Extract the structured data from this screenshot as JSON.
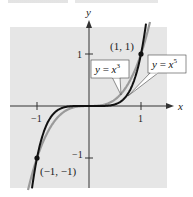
{
  "chart_data": {
    "type": "line",
    "title": "",
    "xlabel": "x",
    "ylabel": "y",
    "xlim": [
      -1.5,
      1.5
    ],
    "ylim": [
      -1.6,
      1.6
    ],
    "grid": false,
    "background": "#e6e6e6",
    "x_ticks": [
      {
        "value": -1,
        "label": "−1"
      },
      {
        "value": 1,
        "label": "1"
      }
    ],
    "y_ticks": [
      {
        "value": 1,
        "label": "1"
      },
      {
        "value": -1,
        "label": "−1"
      }
    ],
    "series": [
      {
        "name": "y = x^3",
        "label": "y = x",
        "exponent": "3",
        "power": 3,
        "color": "#9a9a9a"
      },
      {
        "name": "y = x^5",
        "label": "y = x",
        "exponent": "5",
        "power": 5,
        "color": "#111111"
      }
    ],
    "points": [
      {
        "x": 1,
        "y": 1,
        "label": "(1, 1)"
      },
      {
        "x": -1,
        "y": -1,
        "label": "(−1, −1)"
      }
    ]
  }
}
